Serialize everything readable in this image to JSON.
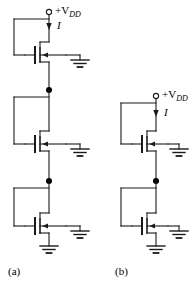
{
  "figure": {
    "kind": "circuit-schematic",
    "panels": [
      {
        "id": "a",
        "caption": "(a)",
        "supply_label_plain": "+V",
        "supply_label_sub": "DD",
        "current_label": "I",
        "stages": 3
      },
      {
        "id": "b",
        "caption": "(b)",
        "supply_label_plain": "+V",
        "supply_label_sub": "DD",
        "current_label": "I",
        "stages": 2
      }
    ],
    "colors": {
      "wire": "#1a1a1a",
      "background": "#ffffff",
      "node_dot": "#000000",
      "terminal_fill": "#ffffff"
    },
    "symbols": {
      "transistor": "mosfet-symbol",
      "ground": "ground-symbol",
      "supply_terminal": "open-circle-terminal",
      "current_arrow": "current-arrow-down",
      "junction": "junction-dot"
    }
  },
  "labels": {
    "panel_a_caption": "(a)",
    "panel_b_caption": "(b)",
    "vdd_plain": "+V",
    "vdd_sub": "DD",
    "current_a": "I",
    "current_b": "I"
  }
}
